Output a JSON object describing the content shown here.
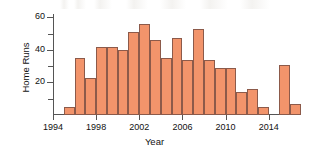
{
  "chart_data": {
    "type": "bar",
    "title": "",
    "xlabel": "Year",
    "ylabel": "Home Runs",
    "categories": [
      1995,
      1996,
      1997,
      1998,
      1999,
      2000,
      2001,
      2002,
      2003,
      2004,
      2005,
      2006,
      2007,
      2008,
      2009,
      2010,
      2011,
      2012,
      2013,
      2015,
      2016
    ],
    "values": [
      5,
      35,
      23,
      42,
      42,
      40,
      51,
      56,
      46,
      35,
      47,
      34,
      53,
      34,
      29,
      29,
      14,
      16,
      5,
      31,
      7
    ],
    "missing_years": [
      1994,
      2014
    ],
    "xlim": [
      1994,
      2017
    ],
    "ylim": [
      0,
      62
    ],
    "xtick_labels": [
      "1994",
      "1998",
      "2002",
      "2006",
      "2010",
      "2014"
    ],
    "xtick_values": [
      1994,
      1998,
      2002,
      2006,
      2010,
      2014
    ],
    "ytick_labels": [
      "20",
      "40",
      "60"
    ],
    "ytick_values": [
      20,
      40,
      60
    ],
    "yminor_ticks": [
      10,
      30,
      50
    ],
    "grid": false,
    "legend": null,
    "bar_color": "#F2946B",
    "bar_edge_color": "#8C5A4A",
    "axis_color": "#555555"
  },
  "axes": {
    "x_title": "Year",
    "y_title": "Home Runs"
  }
}
